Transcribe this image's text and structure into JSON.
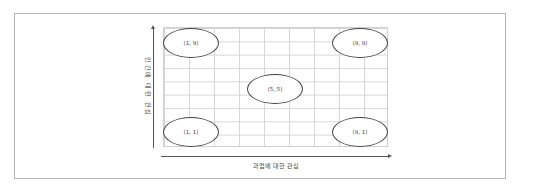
{
  "diagram": {
    "type": "grid-matrix",
    "x_axis_label": "과업에 대한 관심",
    "y_axis_label": "인간에 대한 관심",
    "grid": {
      "columns": 9,
      "rows": 9
    },
    "points": [
      {
        "label": "(1, 9)",
        "x": 1,
        "y": 9
      },
      {
        "label": "(9, 9)",
        "x": 9,
        "y": 9
      },
      {
        "label": "(5, 5)",
        "x": 5,
        "y": 5
      },
      {
        "label": "(1, 1)",
        "x": 1,
        "y": 1
      },
      {
        "label": "(9, 1)",
        "x": 9,
        "y": 1
      }
    ]
  }
}
